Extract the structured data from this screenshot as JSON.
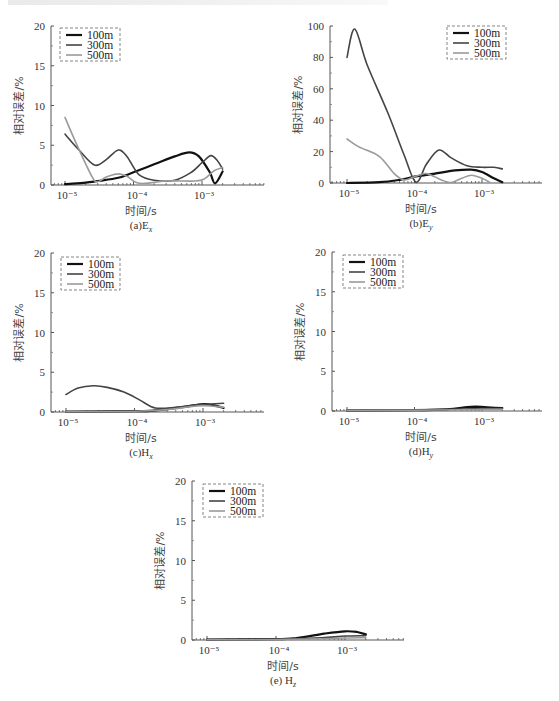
{
  "chart_data": [
    {
      "id": "a",
      "type": "line",
      "caption": "(a)E",
      "caption_sub": "x",
      "xlabel": "时间/s",
      "ylabel": "相对误差/%",
      "xscale": "log",
      "xlim": [
        5e-06,
        0.007
      ],
      "ylim": [
        0,
        20
      ],
      "yticks": [
        "0",
        "5",
        "10",
        "15",
        "20"
      ],
      "xticks": [
        "10⁻⁵",
        "10⁻⁴",
        "10⁻³"
      ],
      "legend": {
        "position": "upper left",
        "entries": [
          "100m",
          "300m",
          "500m"
        ]
      },
      "series": [
        {
          "name": "100m",
          "color": "#111111",
          "width": 2.2,
          "x": [
            1e-05,
            2e-05,
            3e-05,
            6e-05,
            0.0001,
            0.0002,
            0.0004,
            0.00065,
            0.0009,
            0.0013,
            0.00155,
            0.002
          ],
          "y": [
            0.1,
            0.3,
            0.5,
            0.9,
            1.6,
            2.6,
            3.6,
            4.1,
            3.6,
            1.6,
            0.2,
            1.7
          ]
        },
        {
          "name": "300m",
          "color": "#444444",
          "width": 1.6,
          "x": [
            1e-05,
            1.6e-05,
            2.7e-05,
            4e-05,
            6e-05,
            8e-05,
            0.00012,
            0.0002,
            0.0004,
            0.0007,
            0.001,
            0.00135,
            0.0017,
            0.002
          ],
          "y": [
            6.4,
            4.4,
            2.5,
            3.2,
            4.4,
            3.6,
            1.3,
            0.6,
            0.6,
            1.6,
            2.8,
            3.7,
            3.0,
            2.0
          ]
        },
        {
          "name": "500m",
          "color": "#9a9a9a",
          "width": 1.6,
          "x": [
            1e-05,
            1.5e-05,
            2.5e-05,
            3e-05,
            4e-05,
            6e-05,
            8e-05,
            0.00011,
            0.00015,
            0.0003,
            0.0008,
            0.0011,
            0.0015,
            0.002
          ],
          "y": [
            8.5,
            5.0,
            1.0,
            0.4,
            1.0,
            1.4,
            1.1,
            0.3,
            0.2,
            0.5,
            0.5,
            0.8,
            1.8,
            2.2
          ]
        }
      ]
    },
    {
      "id": "b",
      "type": "line",
      "caption": "(b)E",
      "caption_sub": "y",
      "xlabel": "时间/s",
      "ylabel": "相对误差/%",
      "xscale": "log",
      "xlim": [
        5e-06,
        0.007
      ],
      "ylim": [
        0,
        100
      ],
      "yticks": [
        "0",
        "20",
        "40",
        "60",
        "80",
        "100"
      ],
      "xticks": [
        "10⁻⁵",
        "10⁻⁴",
        "10⁻³"
      ],
      "legend": {
        "position": "upper right",
        "entries": [
          "100m",
          "300m",
          "500m"
        ]
      },
      "series": [
        {
          "name": "100m",
          "color": "#111111",
          "width": 2.2,
          "x": [
            1e-05,
            3e-05,
            6e-05,
            0.0001,
            0.0002,
            0.0004,
            0.0007,
            0.001,
            0.0015,
            0.002
          ],
          "y": [
            0,
            0.5,
            2,
            4,
            6,
            8,
            8.5,
            7,
            3,
            0.5
          ]
        },
        {
          "name": "300m",
          "color": "#444444",
          "width": 1.6,
          "x": [
            1e-05,
            1.3e-05,
            2e-05,
            4e-05,
            7e-05,
            0.000105,
            0.00015,
            0.00023,
            0.00035,
            0.0006,
            0.001,
            0.0015,
            0.002
          ],
          "y": [
            80,
            98,
            75,
            45,
            18,
            0.5,
            12,
            21,
            16,
            11,
            10,
            10,
            9
          ]
        },
        {
          "name": "500m",
          "color": "#9a9a9a",
          "width": 1.6,
          "x": [
            1e-05,
            1.5e-05,
            3e-05,
            5e-05,
            7e-05,
            0.0001,
            0.00015,
            0.00025,
            0.00035,
            0.0005,
            0.0007,
            0.001,
            0.0013
          ],
          "y": [
            28,
            23,
            17,
            6,
            2,
            4,
            6,
            2,
            0.3,
            3,
            5,
            3,
            0.5
          ]
        }
      ]
    },
    {
      "id": "c",
      "type": "line",
      "caption": "(c)H",
      "caption_sub": "x",
      "xlabel": "时间/s",
      "ylabel": "相对误差/%",
      "xscale": "log",
      "xlim": [
        5e-06,
        0.007
      ],
      "ylim": [
        0,
        20
      ],
      "yticks": [
        "0",
        "5",
        "10",
        "15",
        "20"
      ],
      "xticks": [
        "10⁻⁵",
        "10⁻⁴",
        "10⁻³"
      ],
      "legend": {
        "position": "upper left",
        "entries": [
          "100m",
          "300m",
          "500m"
        ]
      },
      "series": [
        {
          "name": "100m",
          "color": "#111111",
          "width": 2.2,
          "x": [
            1e-05,
            0.0001,
            0.0002,
            0.0005,
            0.001,
            0.0015,
            0.002
          ],
          "y": [
            0.05,
            0.1,
            0.2,
            0.6,
            1.0,
            0.8,
            0.5
          ]
        },
        {
          "name": "300m",
          "color": "#444444",
          "width": 1.6,
          "x": [
            1e-05,
            1.5e-05,
            2.5e-05,
            4e-05,
            7e-05,
            0.00012,
            0.0002,
            0.0004,
            0.0008,
            0.0013,
            0.002
          ],
          "y": [
            2.2,
            3.0,
            3.3,
            3.1,
            2.5,
            1.5,
            0.5,
            0.6,
            0.9,
            1.0,
            1.1
          ]
        },
        {
          "name": "500m",
          "color": "#9a9a9a",
          "width": 1.6,
          "x": [
            1e-05,
            0.0001,
            0.0003,
            0.0007,
            0.001,
            0.0015,
            0.002
          ],
          "y": [
            0.05,
            0.1,
            0.3,
            0.7,
            0.8,
            0.7,
            0.6
          ]
        }
      ]
    },
    {
      "id": "d",
      "type": "line",
      "caption": "(d)H",
      "caption_sub": "y",
      "xlabel": "时间/s",
      "ylabel": "相对误差/%",
      "xscale": "log",
      "xlim": [
        5e-06,
        0.007
      ],
      "ylim": [
        0,
        20
      ],
      "yticks": [
        "0",
        "5",
        "10",
        "15",
        "20"
      ],
      "xticks": [
        "10⁻⁵",
        "10⁻⁴",
        "10⁻³"
      ],
      "legend": {
        "position": "upper left",
        "entries": [
          "100m",
          "300m",
          "500m"
        ]
      },
      "series": [
        {
          "name": "100m",
          "color": "#111111",
          "width": 2.2,
          "x": [
            1e-05,
            0.0001,
            0.0003,
            0.0006,
            0.0008,
            0.0012,
            0.002
          ],
          "y": [
            0.05,
            0.1,
            0.2,
            0.5,
            0.55,
            0.45,
            0.35
          ]
        },
        {
          "name": "300m",
          "color": "#444444",
          "width": 1.6,
          "x": [
            1e-05,
            0.0001,
            0.0005,
            0.001,
            0.002
          ],
          "y": [
            0.1,
            0.15,
            0.25,
            0.3,
            0.3
          ]
        },
        {
          "name": "500m",
          "color": "#9a9a9a",
          "width": 1.6,
          "x": [
            1e-05,
            0.0001,
            0.0005,
            0.001,
            0.002
          ],
          "y": [
            0.05,
            0.1,
            0.15,
            0.2,
            0.2
          ]
        }
      ]
    },
    {
      "id": "e",
      "type": "line",
      "caption": "(e) H",
      "caption_sub": "z",
      "xlabel": "时间/s",
      "ylabel": "相对误差/%",
      "xscale": "log",
      "xlim": [
        5e-06,
        0.007
      ],
      "ylim": [
        0,
        20
      ],
      "yticks": [
        "0",
        "5",
        "10",
        "15",
        "20"
      ],
      "xticks": [
        "10⁻⁵",
        "10⁻⁴",
        "10⁻³"
      ],
      "legend": {
        "position": "upper left",
        "entries": [
          "100m",
          "300m",
          "500m"
        ]
      },
      "series": [
        {
          "name": "100m",
          "color": "#111111",
          "width": 2.2,
          "x": [
            1e-05,
            0.0001,
            0.0002,
            0.0005,
            0.001,
            0.0015,
            0.002
          ],
          "y": [
            0.05,
            0.1,
            0.25,
            0.8,
            1.1,
            1.0,
            0.7
          ]
        },
        {
          "name": "300m",
          "color": "#444444",
          "width": 1.6,
          "x": [
            1e-05,
            0.0001,
            0.0005,
            0.001,
            0.002
          ],
          "y": [
            0.05,
            0.1,
            0.3,
            0.5,
            0.55
          ]
        },
        {
          "name": "500m",
          "color": "#9a9a9a",
          "width": 1.6,
          "x": [
            1e-05,
            0.0001,
            0.0005,
            0.001,
            0.002
          ],
          "y": [
            0.02,
            0.05,
            0.15,
            0.25,
            0.3
          ]
        }
      ]
    }
  ],
  "layout": {
    "panels": {
      "a": {
        "x0": 51,
        "xAxisEnd": 264,
        "y0": 185,
        "y1": 26,
        "dec": [
          65,
          135,
          202
        ],
        "legend": {
          "x": 60,
          "y": 28,
          "w": 60,
          "h": 33
        }
      },
      "b": {
        "x0": 330,
        "xAxisEnd": 542,
        "y0": 183,
        "y1": 26,
        "dec": [
          347,
          415,
          482
        ],
        "legend": {
          "x": 447,
          "y": 26,
          "w": 59,
          "h": 33
        }
      },
      "c": {
        "x0": 51,
        "xAxisEnd": 264,
        "y0": 412,
        "y1": 253,
        "dec": [
          66,
          135,
          203
        ],
        "legend": {
          "x": 61,
          "y": 257,
          "w": 59,
          "h": 33
        }
      },
      "d": {
        "x0": 332,
        "xAxisEnd": 542,
        "y0": 411,
        "y1": 252,
        "dec": [
          347,
          415,
          482
        ],
        "legend": {
          "x": 343,
          "y": 255,
          "w": 60,
          "h": 33
        }
      },
      "e": {
        "x0": 192,
        "xAxisEnd": 404,
        "y0": 640,
        "y1": 481,
        "dec": [
          207,
          277,
          345
        ],
        "legend": {
          "x": 203,
          "y": 484,
          "w": 60,
          "h": 33
        }
      }
    }
  }
}
